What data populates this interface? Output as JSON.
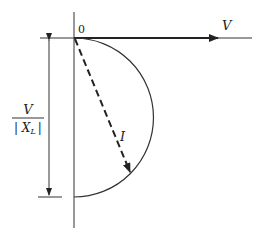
{
  "diagram": {
    "origin_label": "0",
    "voltage_label": "V",
    "current_label": "I",
    "dimension_label": {
      "numerator": "V",
      "denominator": "| X",
      "denominator_sub": "L",
      "denominator_close": "|"
    },
    "colors": {
      "line": "#222222",
      "background": "#ffffff"
    }
  }
}
